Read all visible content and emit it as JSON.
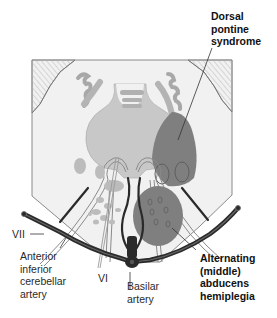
{
  "figure": {
    "colors": {
      "background": "#ffffff",
      "pons_fill": "#f0f0f0",
      "outline": "#8a8a8a",
      "gray_nucleus": "#b9b9b9",
      "lesion": "#7c7c7c",
      "artery": "#2a2a2a",
      "cerebellum_hatch": "#d2d2d2"
    }
  },
  "labels": {
    "dorsal_pontine": "Dorsal\npontine\nsyndrome",
    "cn7": "VII",
    "aica": "Anterior\ninferior\ncerebellar\nartery",
    "cn6": "VI",
    "basilar": "Basilar\nartery",
    "alternating": "Alternating\n(middle)\nabducens\nhemiplegia"
  }
}
